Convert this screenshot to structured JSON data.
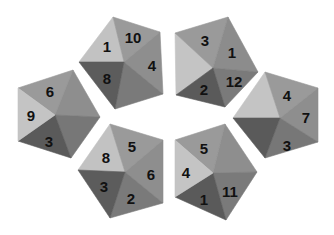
{
  "colors": {
    "background": "#ffffff",
    "shade_light": "#c4c4c4",
    "shade_mid_light": "#a8a8a8",
    "shade_mid": "#8f8f8f",
    "shade_dark": "#6a6a6a",
    "shade_darker": "#5a5a5a",
    "label": "#111111"
  },
  "pentagons": [
    {
      "id": "top-left",
      "center": [
        124,
        62
      ],
      "faces": [
        {
          "label": "1",
          "points": "113,17 79,62 124,62",
          "shade": "#c2c2c2",
          "text": [
            107,
            46
          ]
        },
        {
          "label": "10",
          "points": "113,17 160,32 124,62",
          "shade": "#9a9a9a",
          "text": [
            133,
            37
          ]
        },
        {
          "label": "4",
          "points": "160,32 163,94 124,62",
          "shade": "#8e8e8e",
          "text": [
            152,
            65
          ]
        },
        {
          "label": "",
          "points": "163,94 115,109 124,62",
          "shade": "#7a7a7a",
          "text": [
            0,
            0
          ]
        },
        {
          "label": "8",
          "points": "115,109 79,62 124,62",
          "shade": "#5c5c5c",
          "text": [
            107,
            78
          ]
        }
      ]
    },
    {
      "id": "top-right",
      "center": [
        213,
        68
      ],
      "faces": [
        {
          "label": "",
          "points": "175,33 176,95 213,68",
          "shade": "#c4c4c4",
          "text": [
            0,
            0
          ]
        },
        {
          "label": "3",
          "points": "175,33 228,17 213,68",
          "shade": "#9a9a9a",
          "text": [
            205,
            40
          ]
        },
        {
          "label": "1",
          "points": "228,17 258,72 213,68",
          "shade": "#8c8c8c",
          "text": [
            232,
            52
          ]
        },
        {
          "label": "12",
          "points": "258,72 225,107 213,68",
          "shade": "#7a7a7a",
          "text": [
            234,
            81
          ]
        },
        {
          "label": "2",
          "points": "225,107 176,95 213,68",
          "shade": "#5a5a5a",
          "text": [
            204,
            89
          ]
        }
      ]
    },
    {
      "id": "left",
      "center": [
        55,
        115
      ],
      "faces": [
        {
          "label": "6",
          "points": "18,88 73,70 55,115",
          "shade": "#9a9a9a",
          "text": [
            50,
            91
          ]
        },
        {
          "label": "",
          "points": "73,70 100,117 55,115",
          "shade": "#8e8e8e",
          "text": [
            0,
            0
          ]
        },
        {
          "label": "",
          "points": "100,117 71,158 55,115",
          "shade": "#777777",
          "text": [
            0,
            0
          ]
        },
        {
          "label": "3",
          "points": "71,158 18,141 55,115",
          "shade": "#5a5a5a",
          "text": [
            49,
            141
          ]
        },
        {
          "label": "9",
          "points": "18,141 18,88 55,115",
          "shade": "#c4c4c4",
          "text": [
            31,
            115
          ]
        }
      ]
    },
    {
      "id": "right",
      "center": [
        280,
        118
      ],
      "faces": [
        {
          "label": "",
          "points": "233,118 265,72 280,118",
          "shade": "#c4c4c4",
          "text": [
            0,
            0
          ]
        },
        {
          "label": "4",
          "points": "265,72 318,88 280,118",
          "shade": "#9a9a9a",
          "text": [
            287,
            95
          ]
        },
        {
          "label": "7",
          "points": "318,88 318,142 280,118",
          "shade": "#8e8e8e",
          "text": [
            306,
            117
          ]
        },
        {
          "label": "3",
          "points": "318,142 265,158 280,118",
          "shade": "#777777",
          "text": [
            287,
            145
          ]
        },
        {
          "label": "",
          "points": "265,158 233,118 280,118",
          "shade": "#5a5a5a",
          "text": [
            0,
            0
          ]
        }
      ]
    },
    {
      "id": "bottom-left",
      "center": [
        125,
        172
      ],
      "faces": [
        {
          "label": "8",
          "points": "110,124 78,170 125,172",
          "shade": "#c2c2c2",
          "text": [
            106,
            157
          ]
        },
        {
          "label": "5",
          "points": "110,124 163,140 125,172",
          "shade": "#9a9a9a",
          "text": [
            132,
            146
          ]
        },
        {
          "label": "6",
          "points": "163,140 163,203 125,172",
          "shade": "#8e8e8e",
          "text": [
            151,
            174
          ]
        },
        {
          "label": "2",
          "points": "163,203 110,218 125,172",
          "shade": "#7a7a7a",
          "text": [
            131,
            198
          ]
        },
        {
          "label": "3",
          "points": "110,218 78,170 125,172",
          "shade": "#5c5c5c",
          "text": [
            104,
            186
          ]
        }
      ]
    },
    {
      "id": "bottom-right",
      "center": [
        213,
        173
      ],
      "faces": [
        {
          "label": "5",
          "points": "175,140 225,124 213,173",
          "shade": "#9a9a9a",
          "text": [
            204,
            148
          ]
        },
        {
          "label": "",
          "points": "225,124 257,172 213,173",
          "shade": "#8e8e8e",
          "text": [
            0,
            0
          ]
        },
        {
          "label": "11",
          "points": "257,172 226,220 213,173",
          "shade": "#7a7a7a",
          "text": [
            230,
            191
          ]
        },
        {
          "label": "1",
          "points": "226,220 175,197 213,173",
          "shade": "#5a5a5a",
          "text": [
            204,
            199
          ]
        },
        {
          "label": "4",
          "points": "175,197 175,140 213,173",
          "shade": "#c4c4c4",
          "text": [
            186,
            172
          ]
        }
      ]
    }
  ]
}
